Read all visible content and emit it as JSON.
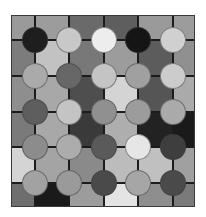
{
  "board": {
    "columns_px": [
      0,
      23,
      57,
      92,
      126,
      161,
      184
    ],
    "rows_px": [
      0,
      24,
      60,
      96,
      131,
      167,
      192
    ],
    "line_color": "#1c1c1c",
    "cells": [
      [
        "#9a9a9a",
        "#9c9c9c",
        "#6a6a6a",
        "#5e5e5e",
        "#9a9a9a",
        "#9c9c9c"
      ],
      [
        "#7c7c7c",
        "#c2c2c2",
        "#787878",
        "#9c9c9c",
        "#5c5c5c",
        "#909090"
      ],
      [
        "#8e8e8e",
        "#a8a8a8",
        "#4e4e4e",
        "#d4d4d4",
        "#555555",
        "#aaaaaa"
      ],
      [
        "#7a7a7a",
        "#a8a8a8",
        "#3a3a3a",
        "#aeaeae",
        "#222222",
        "#1a1a1a"
      ],
      [
        "#d4d4d4",
        "#a4a4a4",
        "#8a8a8a",
        "#bcbcbc",
        "#c0c0c0",
        "#a0a0a0"
      ],
      [
        "#6e6e6e",
        "#1a1a1a",
        "#9c9c9c",
        "#e4e4e4",
        "#8e8e8e",
        "#7a7a7a"
      ]
    ],
    "pieces": [
      [
        "#1e1e1e",
        "#c8c8c8",
        "#ededed",
        "#151515",
        "#d0d0d0"
      ],
      [
        "#aaaaaa",
        "#676767",
        "#c4c4c4",
        "#a0a0a0",
        "#cccccc"
      ],
      [
        "#5e5e5e",
        "#c4c4c4",
        "#909090",
        "#9c9c9c",
        "#aaaaaa"
      ],
      [
        "#8c8c8c",
        "#acacac",
        "#5a5a5a",
        "#e6e6e6",
        "#3e3e3e"
      ],
      [
        "#a2a2a2",
        "#9a9a9a",
        "#4a4a4a",
        "#a6a6a6",
        "#4a4a4a"
      ]
    ]
  }
}
